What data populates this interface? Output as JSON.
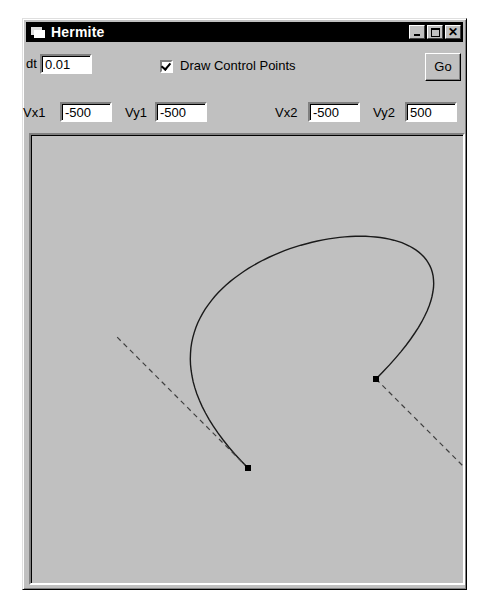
{
  "window": {
    "title": "Hermite",
    "controls": [
      "minimize",
      "maximize",
      "close"
    ],
    "close_glyph": "✕"
  },
  "controls": {
    "dt_label": "dt",
    "dt_value": "0.01",
    "draw_control_points_label": "Draw Control Points",
    "draw_control_points_checked": true,
    "go_label": "Go",
    "vx1_label": "Vx1",
    "vx1_value": "-500",
    "vy1_label": "Vy1",
    "vy1_value": "-500",
    "vx2_label": "Vx2",
    "vx2_value": "-500",
    "vy2_label": "Vy2",
    "vy2_value": "500"
  },
  "canvas": {
    "background": "#c0c0c0",
    "p1": [
      217,
      333
    ],
    "p2": [
      345,
      244
    ],
    "tangent_scale": 1.45,
    "control_line_scale": 0.265,
    "curve_color": "#1a1a1a",
    "control_line_color": "#404040"
  }
}
